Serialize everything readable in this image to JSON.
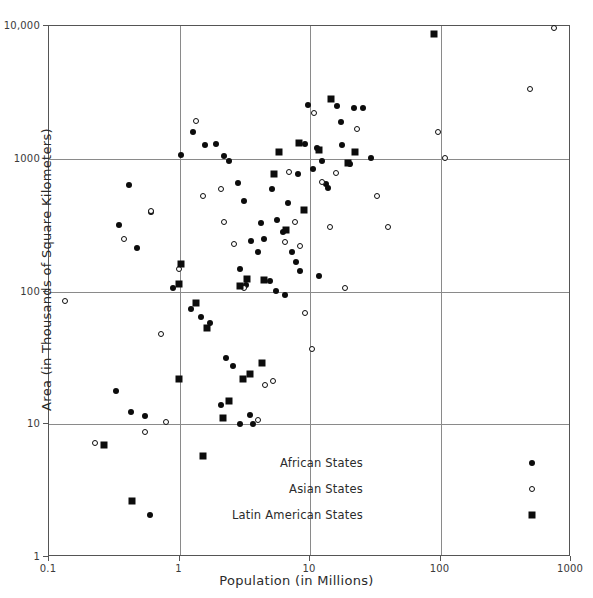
{
  "chart_data": {
    "type": "scatter",
    "title": "",
    "xlabel": "Population (in Millions)",
    "ylabel": "Area (in Thousands of Square Kilometers)",
    "xscale": "log",
    "yscale": "log",
    "xlim": [
      0.1,
      1000
    ],
    "ylim": [
      1,
      10000
    ],
    "grid": true,
    "xticks": [
      0.1,
      1,
      10,
      100,
      1000
    ],
    "xticklabels": [
      "0.1",
      "1",
      "10",
      "100",
      "1000"
    ],
    "yticks": [
      1,
      10,
      100,
      1000,
      10000
    ],
    "yticklabels": [
      "1",
      "10",
      "100",
      "1000",
      "10,000"
    ],
    "legend_position": "lower right",
    "series": [
      {
        "name": "African States",
        "marker": "filled-circle",
        "color": "#0c0c0c",
        "points": [
          [
            0.55,
            11.3
          ],
          [
            0.42,
            620
          ],
          [
            0.35,
            310
          ],
          [
            0.48,
            210
          ],
          [
            0.62,
            390
          ],
          [
            0.33,
            17.5
          ],
          [
            0.43,
            12.2
          ],
          [
            0.6,
            2.05
          ],
          [
            0.9,
            105
          ],
          [
            1.25,
            72
          ],
          [
            1.5,
            63
          ],
          [
            1.75,
            57
          ],
          [
            2.3,
            31
          ],
          [
            2.6,
            27
          ],
          [
            1.3,
            1560
          ],
          [
            1.6,
            1240
          ],
          [
            1.95,
            1260
          ],
          [
            2.25,
            1030
          ],
          [
            2.45,
            945
          ],
          [
            2.85,
            640
          ],
          [
            3.15,
            476
          ],
          [
            3.6,
            238
          ],
          [
            4.1,
            196
          ],
          [
            4.55,
            246
          ],
          [
            4.3,
            322
          ],
          [
            5.2,
            580
          ],
          [
            5.7,
            340
          ],
          [
            6.3,
            275
          ],
          [
            6.9,
            460
          ],
          [
            7.4,
            196
          ],
          [
            7.9,
            163
          ],
          [
            8.6,
            141
          ],
          [
            5.0,
            118
          ],
          [
            5.6,
            100
          ],
          [
            6.6,
            93
          ],
          [
            3.3,
            110
          ],
          [
            2.95,
            146
          ],
          [
            2.1,
            13.8
          ],
          [
            2.95,
            9.8
          ],
          [
            3.5,
            11.6
          ],
          [
            3.75,
            9.9
          ],
          [
            11.5,
            1190
          ],
          [
            12.6,
            945
          ],
          [
            10.8,
            820
          ],
          [
            13.5,
            636
          ],
          [
            9.8,
            2480
          ],
          [
            14.0,
            590
          ],
          [
            16.5,
            2450
          ],
          [
            18.0,
            1240
          ],
          [
            22.0,
            2390
          ],
          [
            26.0,
            2380
          ],
          [
            30.0,
            1000
          ],
          [
            20.5,
            905
          ],
          [
            17.5,
            1850
          ],
          [
            12.0,
            128
          ],
          [
            9.4,
            1270
          ],
          [
            8.2,
            760
          ],
          [
            1.05,
            1050
          ]
        ]
      },
      {
        "name": "Asian States",
        "marker": "open-circle",
        "color": "#0c0c0c",
        "points": [
          [
            0.135,
            83
          ],
          [
            0.23,
            7.1
          ],
          [
            0.55,
            8.6
          ],
          [
            0.38,
            245
          ],
          [
            0.62,
            395
          ],
          [
            0.74,
            47
          ],
          [
            0.8,
            10.3
          ],
          [
            1.0,
            145
          ],
          [
            1.35,
            1880
          ],
          [
            2.25,
            329
          ],
          [
            2.65,
            225
          ],
          [
            3.2,
            104
          ],
          [
            4.1,
            10.5
          ],
          [
            4.6,
            19.5
          ],
          [
            5.3,
            20.8
          ],
          [
            6.6,
            230
          ],
          [
            7.05,
            780
          ],
          [
            7.8,
            330
          ],
          [
            8.6,
            218
          ],
          [
            9.4,
            68
          ],
          [
            10.5,
            36
          ],
          [
            11.0,
            2160
          ],
          [
            12.5,
            652
          ],
          [
            14.5,
            300
          ],
          [
            16.0,
            770
          ],
          [
            19.0,
            105
          ],
          [
            23.5,
            1640
          ],
          [
            33.0,
            513
          ],
          [
            40.0,
            300
          ],
          [
            97.0,
            1560
          ],
          [
            110.0,
            1000
          ],
          [
            490.0,
            3280
          ],
          [
            760.0,
            9500
          ],
          [
            1.55,
            514
          ],
          [
            2.1,
            580
          ]
        ]
      },
      {
        "name": "Latin American States",
        "marker": "filled-square",
        "color": "#0c0c0c",
        "points": [
          [
            0.27,
            6.9
          ],
          [
            0.44,
            2.6
          ],
          [
            1.0,
            21.4
          ],
          [
            1.0,
            111
          ],
          [
            1.55,
            5.7
          ],
          [
            2.2,
            11.0
          ],
          [
            2.45,
            14.8
          ],
          [
            3.1,
            21.5
          ],
          [
            3.5,
            23.5
          ],
          [
            4.4,
            28.5
          ],
          [
            1.05,
            157
          ],
          [
            1.35,
            80
          ],
          [
            1.65,
            52
          ],
          [
            2.95,
            109
          ],
          [
            3.35,
            122
          ],
          [
            4.55,
            119
          ],
          [
            5.4,
            757
          ],
          [
            5.9,
            1100
          ],
          [
            6.7,
            284
          ],
          [
            8.4,
            1285
          ],
          [
            9.1,
            406
          ],
          [
            12.0,
            1140
          ],
          [
            14.8,
            2780
          ],
          [
            22.5,
            1100
          ],
          [
            20.0,
            912
          ],
          [
            90.0,
            8500
          ]
        ]
      }
    ]
  },
  "legend": {
    "items": [
      {
        "label": "African States",
        "marker": "filled-circle"
      },
      {
        "label": "Asian States",
        "marker": "open-circle"
      },
      {
        "label": "Latin American States",
        "marker": "filled-square"
      }
    ]
  }
}
